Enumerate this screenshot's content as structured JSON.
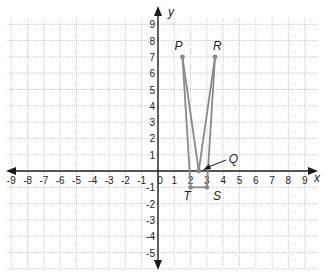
{
  "diagram": {
    "type": "coordinate-plane",
    "axes": {
      "x_label": "x",
      "y_label": "y",
      "x_range": [
        -9,
        9
      ],
      "y_range": [
        -5,
        9
      ],
      "x_ticks": [
        "-9",
        "-8",
        "-7",
        "-6",
        "-5",
        "-4",
        "-3",
        "-2",
        "-1",
        "0",
        "1",
        "2",
        "3",
        "4",
        "5",
        "6",
        "7",
        "8",
        "9"
      ],
      "y_ticks": [
        "9",
        "8",
        "7",
        "6",
        "5",
        "4",
        "3",
        "2",
        "1",
        "-1",
        "-2",
        "-3",
        "-4",
        "-5"
      ]
    },
    "points": [
      {
        "label": "P",
        "x": 1.5,
        "y": 7
      },
      {
        "label": "R",
        "x": 3.5,
        "y": 7
      },
      {
        "label": "Q",
        "x": 2.5,
        "y": 0
      },
      {
        "label": "T",
        "x": 2,
        "y": -1
      },
      {
        "label": "S",
        "x": 3,
        "y": -1
      }
    ],
    "segments": [
      [
        "P",
        "Q"
      ],
      [
        "Q",
        "R"
      ],
      [
        "P",
        "T"
      ],
      [
        "R",
        "S"
      ],
      [
        "T",
        "S"
      ]
    ],
    "colors": {
      "grid": "#bdbdbd",
      "axis": "#1a1a1a",
      "figure": "#8a8a8a"
    }
  }
}
